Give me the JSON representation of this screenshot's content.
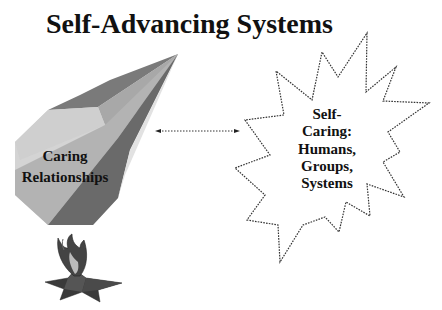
{
  "title": "Self-Advancing Systems",
  "left_node": {
    "lines": [
      "Caring",
      "Relationships"
    ],
    "shape": "faceted-pyramid",
    "icon": "eternal-flame-star-icon"
  },
  "right_node": {
    "lines": [
      "Self-",
      "Caring:",
      "Humans,",
      "Groups,",
      "Systems"
    ],
    "shape": "dashed-starburst"
  },
  "connector": {
    "style": "dotted",
    "direction": "bidirectional"
  },
  "colors": {
    "text": "#111111",
    "facet_light": "#d6d6d6",
    "facet_mid": "#a9a9a9",
    "facet_dark": "#6f6f6f",
    "facet_darker": "#5a5a5a",
    "outline": "#333333"
  }
}
